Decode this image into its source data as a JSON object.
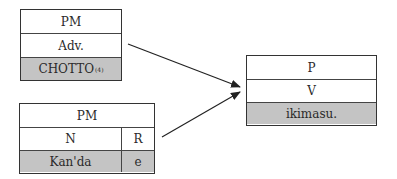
{
  "diagram": {
    "box_adverb": {
      "header": "PM",
      "category": "Adv.",
      "word": "CHOTTO",
      "footnote": "(4)"
    },
    "box_noun_phrase": {
      "header": "PM",
      "category_noun": "N",
      "category_particle": "R",
      "word_noun": "Kan'da",
      "word_particle": "e"
    },
    "box_predicate": {
      "header": "P",
      "category": "V",
      "word": "ikimasu."
    },
    "arrows": [
      {
        "from": "box_adverb",
        "to": "box_predicate"
      },
      {
        "from": "box_noun_phrase",
        "to": "box_predicate"
      }
    ],
    "colors": {
      "shaded_row": "#c4c4c4",
      "border": "#333333",
      "text": "#2a2a2a"
    }
  }
}
